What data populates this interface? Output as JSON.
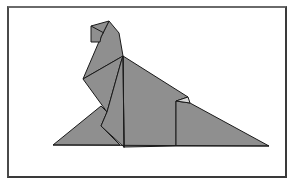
{
  "figure": {
    "colors": {
      "fill": "#8f8f8f",
      "stroke": "#1a1a1a",
      "frame": "#3a3a3a",
      "background": "#ffffff",
      "highlight": "#d8d8d8"
    }
  }
}
